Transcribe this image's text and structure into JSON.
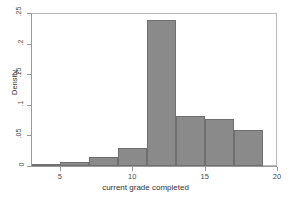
{
  "chart_data": {
    "type": "bar",
    "title": "",
    "subtitle": "",
    "xlabel": "current grade completed",
    "ylabel": "Density",
    "xlim": [
      3,
      20
    ],
    "ylim": [
      0,
      0.25
    ],
    "grid": false,
    "legend": null,
    "bin_width": 2,
    "bin_edges": [
      3,
      5,
      7,
      9,
      11,
      13,
      15,
      17,
      19
    ],
    "categories": [
      "3-5",
      "5-7",
      "7-9",
      "9-11",
      "11-13",
      "13-15",
      "15-17",
      "17-19"
    ],
    "x": [
      4,
      6,
      8,
      10,
      12,
      14,
      16,
      18
    ],
    "values": [
      0.002,
      0.006,
      0.014,
      0.03,
      0.238,
      0.081,
      0.077,
      0.059
    ],
    "xticks": [
      5,
      10,
      15,
      20
    ],
    "xtick_labels": [
      "5",
      "10",
      "15",
      "20"
    ],
    "yticks": [
      0,
      0.05,
      0.1,
      0.15,
      0.2,
      0.25
    ],
    "ytick_labels": [
      "0",
      ".05",
      ".1",
      ".15",
      ".2",
      ".25"
    ],
    "bar_fill_color": "#8a8a8a",
    "bar_edge_color": "#6f6f6f",
    "axis_color": "#9a9a9a",
    "frame_color": "#b9b9b9",
    "background_color": "#ffffff",
    "text_color": "#4a4a4a"
  }
}
